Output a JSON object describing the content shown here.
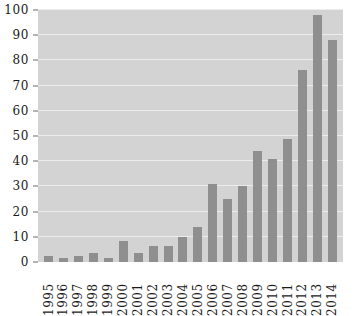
{
  "chart_data": {
    "type": "bar",
    "title": "",
    "subtitle": "",
    "xlabel": "",
    "ylabel": "",
    "categories": [
      "1995",
      "1996",
      "1997",
      "1998",
      "1999",
      "2000",
      "2001",
      "2002",
      "2003",
      "2004",
      "2005",
      "2006",
      "2007",
      "2008",
      "2009",
      "2010",
      "2011",
      "2012",
      "2013",
      "2014"
    ],
    "values": [
      2.5,
      1.5,
      2.5,
      3.5,
      1.5,
      8.5,
      3.5,
      6.5,
      6.5,
      10,
      14,
      31,
      25,
      30,
      44,
      41,
      49,
      76,
      98,
      88
    ],
    "ylim": [
      0,
      100
    ],
    "yticks": [
      0,
      10,
      20,
      30,
      40,
      50,
      60,
      70,
      80,
      90,
      100
    ],
    "ytick_labels": [
      "0",
      "10",
      "20",
      "30",
      "40",
      "50",
      "60",
      "70",
      "80",
      "90",
      "100"
    ],
    "grid": true,
    "grid_axis": "y",
    "legend": false,
    "legend_position": "none",
    "xtick_rotation": 90,
    "series": [
      {
        "name": "series-1",
        "values": [
          2.5,
          1.5,
          2.5,
          3.5,
          1.5,
          8.5,
          3.5,
          6.5,
          6.5,
          10,
          14,
          31,
          25,
          30,
          44,
          41,
          49,
          76,
          98,
          88
        ]
      }
    ]
  },
  "colors": {
    "bar": "#8f8f8f",
    "plot_background": "#d3d3d3",
    "gridline": "#ececec",
    "page_background": "#ffffff",
    "tick_label": "#1a1a1a",
    "tick_mark": "#6b6b6b"
  }
}
